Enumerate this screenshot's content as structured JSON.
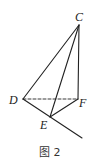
{
  "diagram": {
    "caption": "图 2",
    "points": {
      "C": {
        "label": "C",
        "x": 79,
        "y": 25
      },
      "D": {
        "label": "D",
        "x": 23,
        "y": 99
      },
      "F": {
        "label": "F",
        "x": 78,
        "y": 99
      },
      "E": {
        "label": "E",
        "x": 50,
        "y": 117
      }
    },
    "ray_end": {
      "x": 82,
      "y": 138
    },
    "segments": [
      {
        "from": "C",
        "to": "D",
        "style": "solid"
      },
      {
        "from": "C",
        "to": "E",
        "style": "solid"
      },
      {
        "from": "C",
        "to": "F",
        "style": "solid"
      },
      {
        "from": "E",
        "to": "F",
        "style": "solid"
      },
      {
        "from": "D",
        "to": "E",
        "style": "solid",
        "extended": true
      },
      {
        "from": "D",
        "to": "F",
        "style": "dashed"
      }
    ],
    "line_color": "#222222"
  }
}
